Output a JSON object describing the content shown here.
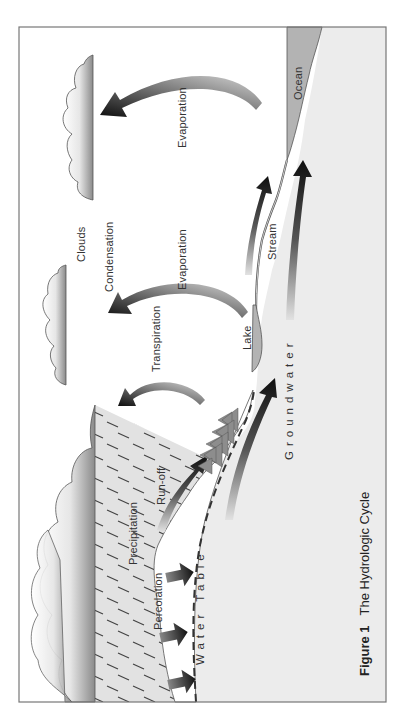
{
  "figure": {
    "caption_number": "Figure 1",
    "caption_title": "The Hydrologic Cycle"
  },
  "labels": {
    "clouds": "Clouds",
    "condensation": "Condensation",
    "evaporation_ocean": "Evaporation",
    "evaporation_lake": "Evaporation",
    "transpiration": "Transpiration",
    "lake": "Lake",
    "stream": "Stream",
    "ocean": "Ocean",
    "groundwater": "Groundwater",
    "precipitation": "Precipitation",
    "runoff": "Run-off",
    "percolation": "Percolation",
    "water_table": "Water Table"
  },
  "colors": {
    "ground": "#ececec",
    "water": "#b0b0b0",
    "frame": "#777777",
    "arrow_dark": "#111111",
    "arrow_light": "#d0d0d0",
    "tree": "#888888",
    "rain_region": "#e0e0e0"
  }
}
